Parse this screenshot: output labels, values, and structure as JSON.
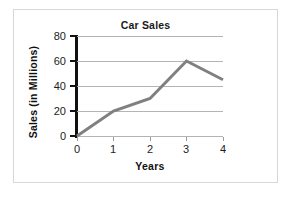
{
  "chart_data": {
    "type": "line",
    "title": "Car Sales",
    "xlabel": "Years",
    "ylabel": "Sales (in Millions)",
    "x": [
      0,
      1,
      2,
      3,
      4
    ],
    "values": [
      0,
      20,
      30,
      60,
      45
    ],
    "xtick_labels": [
      "0",
      "1",
      "2",
      "3",
      "4"
    ],
    "ytick_labels": [
      "0",
      "20",
      "40",
      "60",
      "80"
    ],
    "yticks": [
      0,
      20,
      40,
      60,
      80
    ],
    "xlim": [
      0,
      4
    ],
    "ylim": [
      0,
      80
    ],
    "grid": "horizontal",
    "legend": "none",
    "series_color": "#808080",
    "axis_color": "#111111",
    "gridline_color": "#b4b4b4",
    "border_color": "#d8d8d8"
  }
}
